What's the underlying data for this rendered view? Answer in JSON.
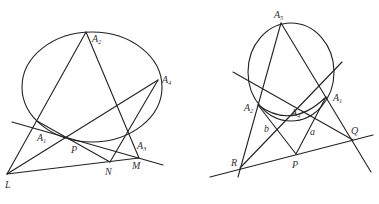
{
  "figures": [
    {
      "id": "left",
      "description": "Ellipse with inscribed quadrilateral A1A2A3A4 and points L, P, N, M",
      "conic": {
        "type": "ellipse",
        "cx": 92,
        "cy": 87,
        "rx": 70,
        "ry": 55
      },
      "points": {
        "A1": {
          "x": 37,
          "y": 121,
          "label": "A",
          "sub": "1",
          "lx": 37,
          "ly": 141
        },
        "A2": {
          "x": 86,
          "y": 32,
          "label": "A",
          "sub": "2",
          "lx": 92,
          "ly": 42
        },
        "A3": {
          "x": 129,
          "y": 132,
          "label": "A",
          "sub": "3",
          "lx": 137,
          "ly": 149
        },
        "A4": {
          "x": 158,
          "y": 80,
          "label": "A",
          "sub": "4",
          "lx": 162,
          "ly": 83
        },
        "P": {
          "x": 67,
          "y": 137,
          "label": "P",
          "sub": "",
          "lx": 71,
          "ly": 153
        },
        "N": {
          "x": 110,
          "y": 162,
          "label": "N",
          "sub": "",
          "lx": 105,
          "ly": 175
        },
        "M": {
          "x": 139,
          "y": 158,
          "label": "M",
          "sub": "",
          "lx": 132,
          "ly": 169
        },
        "L": {
          "x": 7,
          "y": 174,
          "label": "L",
          "sub": "",
          "lx": 5,
          "ly": 188
        }
      }
    },
    {
      "id": "right",
      "description": "Circle with inscribed points A1..A5, tangent-like lines, and points P, Q, R with labels a, b",
      "conic": {
        "type": "ellipse",
        "cx": 291,
        "cy": 72,
        "rx": 43,
        "ry": 49
      },
      "points": {
        "A5": {
          "x": 281,
          "y": 23,
          "label": "A",
          "sub": "5",
          "lx": 274,
          "ly": 18
        },
        "A2": {
          "x": 258,
          "y": 105,
          "label": "A",
          "sub": "2",
          "lx": 244,
          "ly": 111
        },
        "A4": {
          "x": 296,
          "y": 120,
          "label": "A",
          "sub": "4",
          "lx": 292,
          "ly": 116
        },
        "A1": {
          "x": 326,
          "y": 97,
          "label": "A",
          "sub": "1",
          "lx": 333,
          "ly": 101
        },
        "Q": {
          "x": 353,
          "y": 140,
          "label": "Q",
          "sub": "",
          "lx": 351,
          "ly": 134
        },
        "P": {
          "x": 296,
          "y": 154,
          "label": "P",
          "sub": "",
          "lx": 292,
          "ly": 168
        },
        "R": {
          "x": 240,
          "y": 168,
          "label": "R",
          "sub": "",
          "lx": 231,
          "ly": 166
        }
      },
      "segment_labels": [
        {
          "text": "b",
          "x": 264,
          "y": 132
        },
        {
          "text": "a",
          "x": 310,
          "y": 135
        }
      ]
    }
  ]
}
